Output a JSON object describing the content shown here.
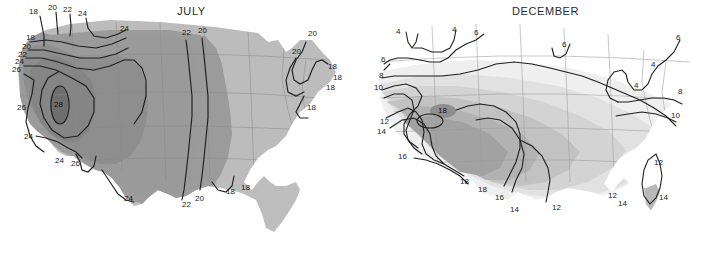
{
  "figure": {
    "kind": "two-panel-contour-map",
    "region": "United States",
    "background": "#ffffff"
  },
  "panels": [
    {
      "id": "july",
      "title": "JULY",
      "fill_colors": [
        "#9c9c9c",
        "#bdbdbd",
        "#8a8a8a",
        "#777777"
      ],
      "labels": [
        {
          "text": "18",
          "x": 33,
          "y": 12
        },
        {
          "text": "20",
          "x": 52,
          "y": 8
        },
        {
          "text": "22",
          "x": 66,
          "y": 10
        },
        {
          "text": "24",
          "x": 80,
          "y": 14
        },
        {
          "text": "24",
          "x": 124,
          "y": 29
        },
        {
          "text": "22",
          "x": 186,
          "y": 33
        },
        {
          "text": "20",
          "x": 202,
          "y": 31
        },
        {
          "text": "20",
          "x": 312,
          "y": 34
        },
        {
          "text": "20",
          "x": 296,
          "y": 52
        },
        {
          "text": "18",
          "x": 332,
          "y": 67
        },
        {
          "text": "18",
          "x": 337,
          "y": 78
        },
        {
          "text": "18",
          "x": 330,
          "y": 88
        },
        {
          "text": "18",
          "x": 311,
          "y": 108
        },
        {
          "text": "18",
          "x": 30,
          "y": 38
        },
        {
          "text": "20",
          "x": 26,
          "y": 47
        },
        {
          "text": "22",
          "x": 22,
          "y": 55
        },
        {
          "text": "24",
          "x": 19,
          "y": 62
        },
        {
          "text": "26",
          "x": 16,
          "y": 70
        },
        {
          "text": "28",
          "x": 58,
          "y": 105
        },
        {
          "text": "26",
          "x": 21,
          "y": 108
        },
        {
          "text": "24",
          "x": 28,
          "y": 137
        },
        {
          "text": "24",
          "x": 59,
          "y": 161
        },
        {
          "text": "26",
          "x": 75,
          "y": 164
        },
        {
          "text": "24",
          "x": 128,
          "y": 199
        },
        {
          "text": "22",
          "x": 186,
          "y": 205
        },
        {
          "text": "20",
          "x": 199,
          "y": 199
        },
        {
          "text": "18",
          "x": 230,
          "y": 192
        },
        {
          "text": "18",
          "x": 245,
          "y": 188
        }
      ]
    },
    {
      "id": "december",
      "title": "DECEMBER",
      "fill_colors": [
        "#ffffff",
        "#eeeeee",
        "#dddddd",
        "#cacaca",
        "#b4b4b4",
        "#a0a0a0",
        "#8d8d8d"
      ],
      "labels": [
        {
          "text": "4",
          "x": 40,
          "y": 32
        },
        {
          "text": "4",
          "x": 94,
          "y": 30
        },
        {
          "text": "6",
          "x": 116,
          "y": 33
        },
        {
          "text": "6",
          "x": 204,
          "y": 45
        },
        {
          "text": "6",
          "x": 318,
          "y": 38
        },
        {
          "text": "4",
          "x": 293,
          "y": 65
        },
        {
          "text": "4",
          "x": 276,
          "y": 86
        },
        {
          "text": "6",
          "x": 24,
          "y": 60
        },
        {
          "text": "8",
          "x": 22,
          "y": 76
        },
        {
          "text": "10",
          "x": 19,
          "y": 88
        },
        {
          "text": "8",
          "x": 320,
          "y": 92
        },
        {
          "text": "10",
          "x": 315,
          "y": 116
        },
        {
          "text": "12",
          "x": 24,
          "y": 122
        },
        {
          "text": "14",
          "x": 21,
          "y": 132
        },
        {
          "text": "16",
          "x": 42,
          "y": 157
        },
        {
          "text": "18",
          "x": 81,
          "y": 115
        },
        {
          "text": "18",
          "x": 104,
          "y": 182
        },
        {
          "text": "18",
          "x": 122,
          "y": 190
        },
        {
          "text": "16",
          "x": 139,
          "y": 198
        },
        {
          "text": "14",
          "x": 154,
          "y": 210
        },
        {
          "text": "12",
          "x": 196,
          "y": 208
        },
        {
          "text": "12",
          "x": 298,
          "y": 163
        },
        {
          "text": "12",
          "x": 252,
          "y": 196
        },
        {
          "text": "14",
          "x": 262,
          "y": 204
        },
        {
          "text": "14",
          "x": 303,
          "y": 198
        }
      ]
    }
  ]
}
